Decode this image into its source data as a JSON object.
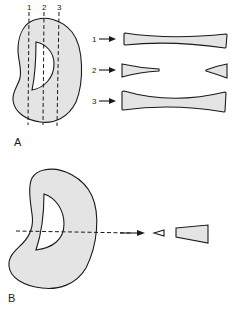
{
  "diagram": {
    "panel_a": {
      "label": "A",
      "section_lines": [
        "1",
        "2",
        "3"
      ],
      "cross_sections": [
        {
          "label": "1",
          "description": "continuous bowtie, thin center"
        },
        {
          "label": "2",
          "description": "two separated wedges (void)"
        },
        {
          "label": "3",
          "description": "continuous bowtie, thicker center"
        }
      ]
    },
    "panel_b": {
      "label": "B",
      "description": "horizontal dashed section producing a small hollow wedge and a larger filled wedge"
    }
  }
}
